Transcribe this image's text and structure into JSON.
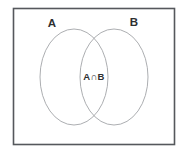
{
  "figure": {
    "type": "venn-diagram",
    "title": "",
    "universe": {
      "label": "",
      "border_color": "#55585c",
      "fill_color": "#ffffff"
    },
    "sets": [
      {
        "name": "set-a",
        "label": "A",
        "label_x": 52,
        "label_y": 27,
        "ellipse": {
          "cx": 74,
          "cy": 77,
          "rx": 34,
          "ry": 48
        },
        "stroke_color": "#a3a5a8"
      },
      {
        "name": "set-b",
        "label": "B",
        "label_x": 134,
        "label_y": 26,
        "ellipse": {
          "cx": 114,
          "cy": 77,
          "rx": 34,
          "ry": 48
        },
        "stroke_color": "#a3a5a8"
      }
    ],
    "regions": [
      {
        "name": "intersection",
        "label": "A∩B",
        "label_x": 94,
        "label_y": 77,
        "description": "overlap of A and B"
      }
    ],
    "canvas": {
      "width": 189,
      "height": 155
    },
    "frame_rect": {
      "x": 13.5,
      "y": 8.5,
      "width": 161,
      "height": 136
    }
  }
}
